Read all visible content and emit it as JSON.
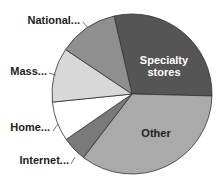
{
  "chart_data": {
    "type": "pie",
    "title": "",
    "categories": [
      "Specialty stores",
      "Other",
      "Internet...",
      "Home...",
      "Mass...",
      "National..."
    ],
    "values": [
      29,
      35,
      5,
      8,
      11,
      12
    ],
    "unit": "percent (estimated)",
    "start_angle_deg": -13,
    "direction": "clockwise",
    "colors": [
      "#555555",
      "#aaaaaa",
      "#7a7a7a",
      "#ffffff",
      "#d8d8d8",
      "#8f8f8f"
    ],
    "label_colors": [
      "#ffffff",
      "#222222",
      "#222222",
      "#222222",
      "#222222",
      "#222222"
    ],
    "legend": "none",
    "labels": {
      "specialty_line1": "Specialty",
      "specialty_line2": "stores",
      "other": "Other",
      "internet": "Internet...",
      "home": "Home...",
      "mass": "Mass...",
      "national": "National..."
    }
  }
}
